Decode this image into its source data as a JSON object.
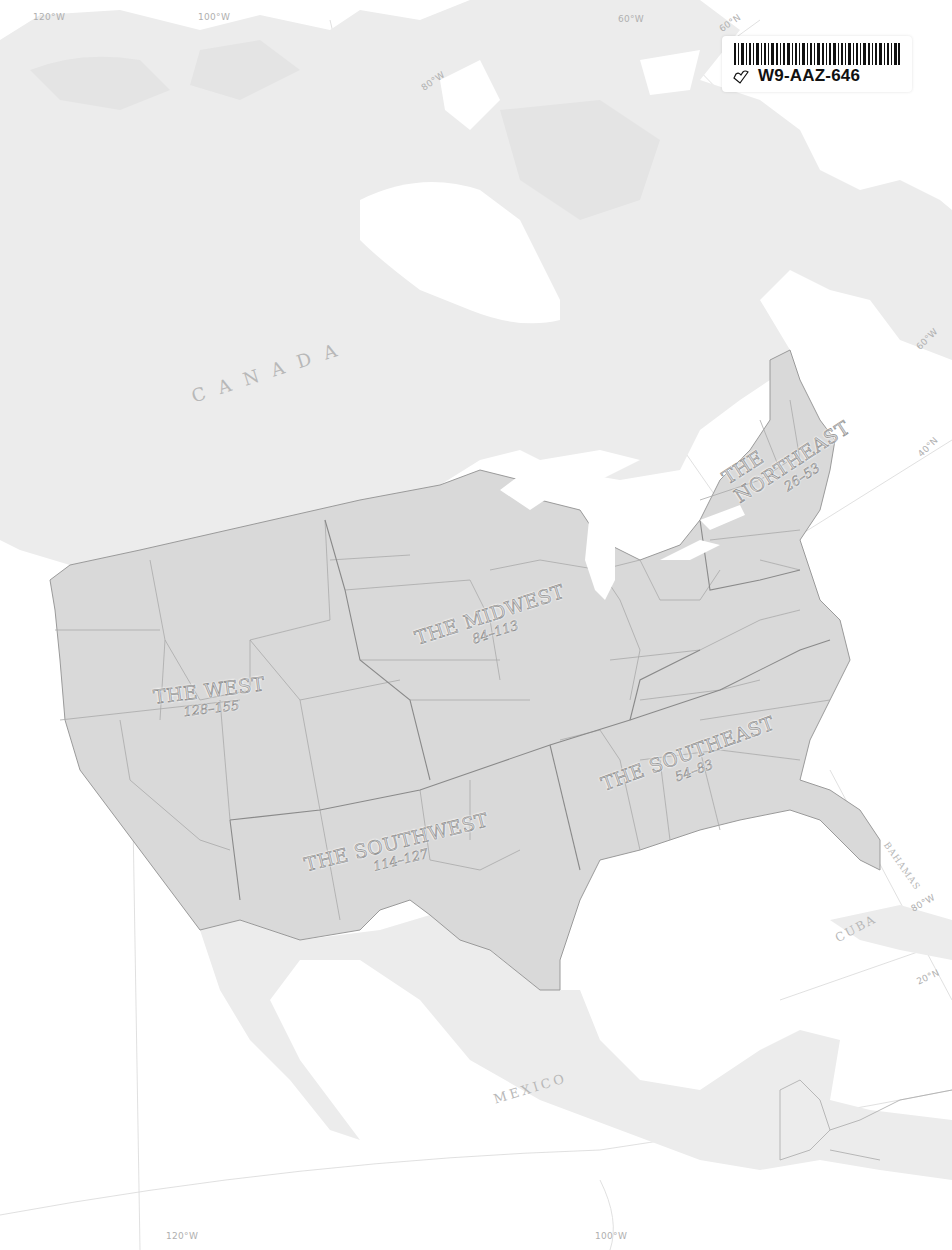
{
  "map": {
    "title": "North America regional index map",
    "colors": {
      "background": "#ffffff",
      "land": "#ececec",
      "us_fill": "#d9d9d9",
      "borders": "#9a9a9a",
      "labels": "#b8b8b8"
    },
    "regions": [
      {
        "name": "THE NORTHEAST",
        "line1": "THE",
        "line2": "NORTHEAST",
        "pages": "26–53"
      },
      {
        "name": "THE MIDWEST",
        "pages": "84–113"
      },
      {
        "name": "THE WEST",
        "pages": "128–155"
      },
      {
        "name": "THE SOUTHEAST",
        "pages": "54–83"
      },
      {
        "name": "THE SOUTHWEST",
        "pages": "114–127"
      }
    ],
    "countries": [
      {
        "name": "CANADA",
        "display": "C A N A D A"
      },
      {
        "name": "MEXICO",
        "display": "MEXICO"
      },
      {
        "name": "CUBA",
        "display": "CUBA"
      },
      {
        "name": "BAHAMAS",
        "display": "BAHAMAS"
      }
    ],
    "graticule_labels": {
      "top_120w": "120°W",
      "top_100w": "100°W",
      "top_80w": "80°W",
      "top_60w": "60°W",
      "top_60n": "60°N",
      "right_60w": "60°W",
      "right_40n": "40°N",
      "right_80w": "80°W",
      "right_20n": "20°N",
      "bottom_120w": "120°W",
      "bottom_100w": "100°W"
    }
  },
  "sticker": {
    "code": "W9-AAZ-646",
    "icon": "bookmark-heart-icon"
  }
}
